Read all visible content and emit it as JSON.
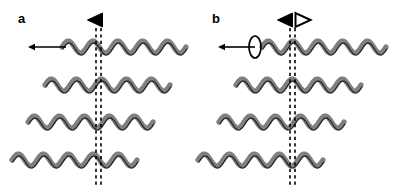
{
  "figure": {
    "width": 394,
    "height": 186,
    "background": "#ffffff",
    "wave_color": "#808080",
    "outline_color": "#1a1a1a",
    "marker_color": "#000000",
    "dashed_line_color": "#000000"
  },
  "panels": [
    {
      "id": "a",
      "label": "a",
      "label_x": 18,
      "label_y": 12,
      "origin_x": 0,
      "marker": {
        "name": "filled-left-triangle",
        "type": "filled",
        "direction": "left",
        "x": 95,
        "y": 20
      },
      "open_marker": null,
      "arrow": {
        "name": "leftward-arrow",
        "direction": "left",
        "x1": 66,
        "x2": 28,
        "y": 47
      },
      "rotation_marker": null,
      "dashed_lines": [
        {
          "x": 96,
          "y_top": 28,
          "y_bottom": 186
        },
        {
          "x": 101,
          "y_top": 28,
          "y_bottom": 186
        }
      ],
      "rows": [
        {
          "y": 47,
          "x_start": 62,
          "x_end": 186,
          "cycles": 5
        },
        {
          "y": 85,
          "x_start": 45,
          "x_end": 170,
          "cycles": 5
        },
        {
          "y": 122,
          "x_start": 28,
          "x_end": 153,
          "cycles": 5
        },
        {
          "y": 160,
          "x_start": 12,
          "x_end": 137,
          "cycles": 5
        }
      ]
    },
    {
      "id": "b",
      "label": "b",
      "label_x": 212,
      "label_y": 12,
      "origin_x": 197,
      "marker": {
        "name": "filled-left-triangle",
        "type": "filled",
        "direction": "left",
        "x": 285,
        "y": 20
      },
      "open_marker": {
        "name": "open-right-triangle",
        "type": "open",
        "direction": "right",
        "x": 303,
        "y": 20
      },
      "arrow": {
        "name": "leftward-arrow",
        "direction": "left",
        "x1": 255,
        "x2": 218,
        "y": 47
      },
      "rotation_marker": {
        "name": "rotation-ellipse",
        "cx": 255,
        "cy": 47,
        "rx": 6,
        "ry": 11
      },
      "dashed_lines": [
        {
          "x": 290,
          "y_top": 28,
          "y_bottom": 186
        },
        {
          "x": 295,
          "y_top": 28,
          "y_bottom": 186
        }
      ],
      "rows": [
        {
          "y": 47,
          "x_start": 262,
          "x_end": 386,
          "cycles": 5
        },
        {
          "y": 85,
          "x_start": 236,
          "x_end": 361,
          "cycles": 5
        },
        {
          "y": 122,
          "x_start": 219,
          "x_end": 344,
          "cycles": 5
        },
        {
          "y": 160,
          "x_start": 198,
          "x_end": 323,
          "cycles": 5
        }
      ]
    }
  ]
}
